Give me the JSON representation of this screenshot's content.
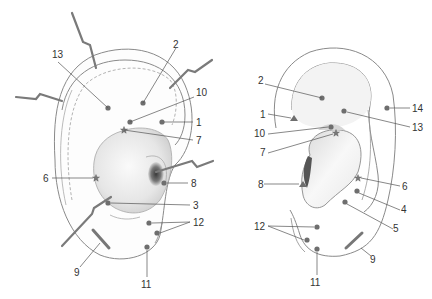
{
  "colors": {
    "outline": "#8a8a8a",
    "leader": "#555555",
    "point": "#6e6e6e",
    "label": "#333333",
    "concha_fill": "#ececec",
    "scapha_fill": "#f6f6f6",
    "probe": "#7a7a7a"
  },
  "left_ear": {
    "view": "anterior",
    "points": [
      {
        "id": "13",
        "label": "13",
        "marker": "dot"
      },
      {
        "id": "2",
        "label": "2",
        "marker": "dot"
      },
      {
        "id": "10",
        "label": "10",
        "marker": "dot"
      },
      {
        "id": "1",
        "label": "1",
        "marker": "dot"
      },
      {
        "id": "7",
        "label": "7",
        "marker": "star"
      },
      {
        "id": "6",
        "label": "6",
        "marker": "star"
      },
      {
        "id": "8",
        "label": "8",
        "marker": "dot"
      },
      {
        "id": "3",
        "label": "3",
        "marker": "dot"
      },
      {
        "id": "12",
        "label": "12",
        "marker": "dot-pair"
      },
      {
        "id": "9",
        "label": "9",
        "marker": "bar"
      },
      {
        "id": "11",
        "label": "11",
        "marker": "dot"
      }
    ]
  },
  "right_ear": {
    "view": "anterior",
    "points": [
      {
        "id": "2",
        "label": "2",
        "marker": "dot"
      },
      {
        "id": "1",
        "label": "1",
        "marker": "triangle"
      },
      {
        "id": "10",
        "label": "10",
        "marker": "dot"
      },
      {
        "id": "7",
        "label": "7",
        "marker": "star"
      },
      {
        "id": "14",
        "label": "14",
        "marker": "dot"
      },
      {
        "id": "13",
        "label": "13",
        "marker": "dot"
      },
      {
        "id": "8",
        "label": "8",
        "marker": "triangle"
      },
      {
        "id": "6",
        "label": "6",
        "marker": "star"
      },
      {
        "id": "4",
        "label": "4",
        "marker": "dot"
      },
      {
        "id": "5",
        "label": "5",
        "marker": "dot"
      },
      {
        "id": "12",
        "label": "12",
        "marker": "dot-pair"
      },
      {
        "id": "9",
        "label": "9",
        "marker": "bar"
      },
      {
        "id": "11",
        "label": "11",
        "marker": "dot"
      }
    ]
  }
}
